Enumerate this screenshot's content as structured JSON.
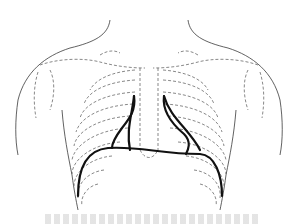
{
  "figure": {
    "colors": {
      "outline": "#3a3a3a",
      "ribs": "#555555",
      "highlight": "#111111",
      "caption": "#cfcfcf"
    }
  }
}
